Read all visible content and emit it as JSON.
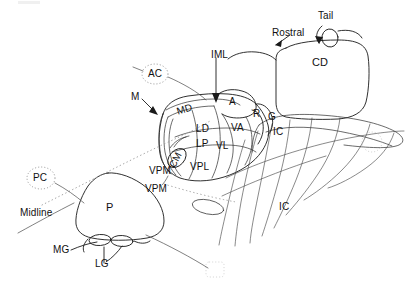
{
  "figure": {
    "type": "line-diagram",
    "background_color": "#ffffff",
    "ink_color": "#1a1a1a"
  },
  "orientation": {
    "rostral_label": "Rostral",
    "midline_label": "Midline",
    "tail_label": "Tail"
  },
  "thalamic_nuclei": [
    {
      "id": "M",
      "label": "M"
    },
    {
      "id": "MD",
      "label": "MD"
    },
    {
      "id": "A",
      "label": "A"
    },
    {
      "id": "R",
      "label": "R"
    },
    {
      "id": "LD",
      "label": "LD"
    },
    {
      "id": "LP",
      "label": "LP"
    },
    {
      "id": "VA",
      "label": "VA"
    },
    {
      "id": "VL",
      "label": "VL"
    },
    {
      "id": "CM",
      "label": "CM"
    },
    {
      "id": "VPM",
      "label": "VPM"
    },
    {
      "id": "VPL",
      "label": "VPL"
    },
    {
      "id": "VPM2",
      "label": "VPM"
    },
    {
      "id": "P",
      "label": "P"
    },
    {
      "id": "MG",
      "label": "MG"
    },
    {
      "id": "LG",
      "label": "LG"
    }
  ],
  "other_structures": [
    {
      "id": "CD",
      "label": "CD"
    },
    {
      "id": "G",
      "label": "G"
    },
    {
      "id": "IC1",
      "label": "IC"
    },
    {
      "id": "IC2",
      "label": "IC"
    },
    {
      "id": "IML",
      "label": "IML"
    }
  ],
  "commissures": [
    {
      "id": "AC",
      "label": "AC"
    },
    {
      "id": "PC",
      "label": "PC"
    }
  ],
  "labels": {
    "M": "M",
    "MD": "MD",
    "A": "A",
    "R": "R",
    "LD": "LD",
    "LP": "LP",
    "VA": "VA",
    "VL": "VL",
    "CM": "CM",
    "VPM_upper": "VPM",
    "VPL": "VPL",
    "VPM_lower": "VPM",
    "P": "P",
    "MG": "MG",
    "LG": "LG",
    "CD": "CD",
    "G": "G",
    "IC_upper": "IC",
    "IC_lower": "IC",
    "IML": "IML",
    "AC": "AC",
    "PC": "PC",
    "Rostral": "Rostral",
    "Midline": "Midline",
    "Tail": "Tail"
  }
}
